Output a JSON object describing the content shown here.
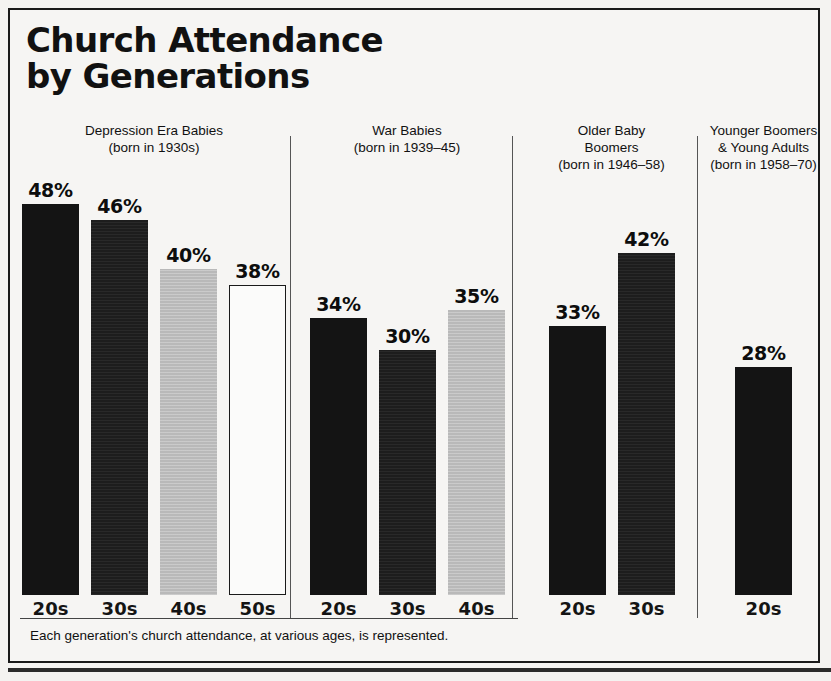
{
  "chart_data": {
    "type": "bar",
    "title": "Church Attendance by Generations",
    "title_line1": "Church Attendance",
    "title_line2": "by Generations",
    "caption": "Each generation's church attendance, at various ages, is represented.",
    "xlabel": "",
    "ylabel": "",
    "ylim": [
      0,
      50
    ],
    "grid": false,
    "legend": "none",
    "value_suffix": "%",
    "groups": [
      {
        "name": "Depression Era Babies",
        "subtitle": "(born in 1930s)",
        "categories": [
          "20s",
          "30s",
          "40s",
          "50s"
        ],
        "values": [
          48,
          46,
          40,
          38
        ],
        "value_labels": [
          "48%",
          "46%",
          "40%",
          "38%"
        ],
        "styles": [
          "black",
          "dark",
          "gray",
          "outline"
        ]
      },
      {
        "name": "War Babies",
        "subtitle": "(born in 1939–45)",
        "categories": [
          "20s",
          "30s",
          "40s"
        ],
        "values": [
          34,
          30,
          35
        ],
        "value_labels": [
          "34%",
          "30%",
          "35%"
        ],
        "styles": [
          "black",
          "dark",
          "gray"
        ]
      },
      {
        "name": "Older Baby Boomers",
        "name_line1": "Older Baby",
        "name_line2": "Boomers",
        "subtitle": "(born in 1946–58)",
        "categories": [
          "20s",
          "30s"
        ],
        "values": [
          33,
          42
        ],
        "value_labels": [
          "33%",
          "42%"
        ],
        "styles": [
          "black",
          "dark"
        ]
      },
      {
        "name": "Younger Boomers & Young Adults",
        "name_line1": "Younger Boomers",
        "name_line2": "& Young Adults",
        "subtitle": "(born in 1958–70)",
        "categories": [
          "20s"
        ],
        "values": [
          28
        ],
        "value_labels": [
          "28%"
        ],
        "styles": [
          "black"
        ]
      }
    ]
  },
  "colors": {
    "ink": "#141414",
    "gray_bar": "#b9b9b9",
    "paper": "#f6f5f3",
    "frame": "#1a1a1a"
  }
}
